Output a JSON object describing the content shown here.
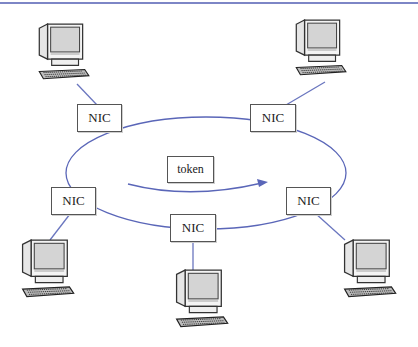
{
  "diagram": {
    "type": "token-ring-network",
    "colors": {
      "ring": "#5a66b8",
      "links": "#6a76bf",
      "top_rule": "#7d86c6",
      "box_border": "#555555"
    },
    "token": {
      "label": "token"
    },
    "nodes": [
      {
        "id": "top-left",
        "nic_label": "NIC"
      },
      {
        "id": "top-right",
        "nic_label": "NIC"
      },
      {
        "id": "left",
        "nic_label": "NIC"
      },
      {
        "id": "bottom",
        "nic_label": "NIC"
      },
      {
        "id": "right",
        "nic_label": "NIC"
      }
    ]
  }
}
